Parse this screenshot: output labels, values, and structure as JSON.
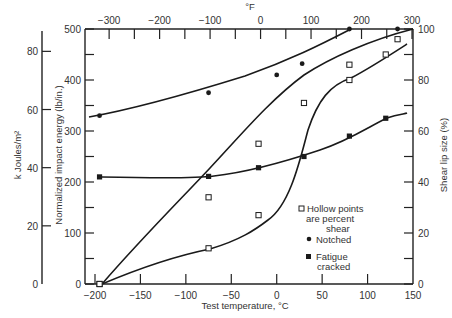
{
  "chart_data": {
    "type": "line",
    "title": "",
    "xlabel": "Test temperature, °C",
    "x2label": "°F",
    "ylabel": "Normalized impact energy (lb/in.)",
    "y2label_left": "k Joules/m²",
    "y_right_label": "Shear lip size (%)",
    "xlim": [
      -200,
      150
    ],
    "x_ticks": [
      -200,
      -150,
      -100,
      -50,
      0,
      50,
      100,
      150
    ],
    "x2_ticks_F": [
      -300,
      -200,
      -100,
      0,
      100,
      200,
      300
    ],
    "ylim": [
      0,
      500
    ],
    "y_ticks": [
      0,
      100,
      200,
      300,
      400,
      500
    ],
    "kj_ticks": [
      0,
      20,
      40,
      60,
      80
    ],
    "y_right_ticks": [
      0,
      20,
      40,
      60,
      80,
      100
    ],
    "grid": false,
    "legend": {
      "position": "lower-right-inside",
      "entries": [
        {
          "marker": "hollow-square",
          "text_lines": [
            "Hollow points",
            "are percent",
            "shear"
          ]
        },
        {
          "marker": "filled-circle",
          "text_lines": [
            "Notched"
          ]
        },
        {
          "marker": "filled-square",
          "text_lines": [
            "Fatigue",
            "cracked"
          ]
        }
      ]
    },
    "series": [
      {
        "name": "Notched (impact energy)",
        "marker": "filled-circle",
        "axis": "left",
        "x": [
          -195,
          -75,
          0,
          80
        ],
        "y": [
          330,
          375,
          410,
          500
        ]
      },
      {
        "name": "Notched (scatter outliers)",
        "marker": "filled-circle",
        "axis": "left",
        "x": [
          28,
          133
        ],
        "y": [
          432,
          500
        ]
      },
      {
        "name": "Fatigue cracked (impact energy)",
        "marker": "filled-square",
        "axis": "left",
        "x": [
          -195,
          -75,
          -20,
          30,
          80,
          120
        ],
        "y": [
          210,
          211,
          228,
          250,
          290,
          325
        ]
      },
      {
        "name": "Notched (percent shear)",
        "marker": "hollow-square",
        "axis": "right",
        "x": [
          -195,
          -75,
          -20,
          30,
          80,
          133
        ],
        "y": [
          0,
          34,
          55,
          71,
          86,
          96
        ]
      },
      {
        "name": "Fatigue cracked (percent shear)",
        "marker": "hollow-square",
        "axis": "right",
        "x": [
          -195,
          -75,
          -20,
          80,
          120
        ],
        "y": [
          0,
          14,
          27,
          80,
          90
        ]
      }
    ]
  },
  "labels": {
    "x_title": "Test temperature, °C",
    "x2_title": "°F",
    "y_title": "Normalized impact energy (lb/in.)",
    "kj_title": "k Joules/m²",
    "y_right_title": "Shear lip size (%)",
    "legend_hollow_1": "Hollow points",
    "legend_hollow_2": "are percent",
    "legend_hollow_3": "shear",
    "legend_notched": "Notched",
    "legend_fatigue_1": "Fatigue",
    "legend_fatigue_2": "cracked"
  }
}
